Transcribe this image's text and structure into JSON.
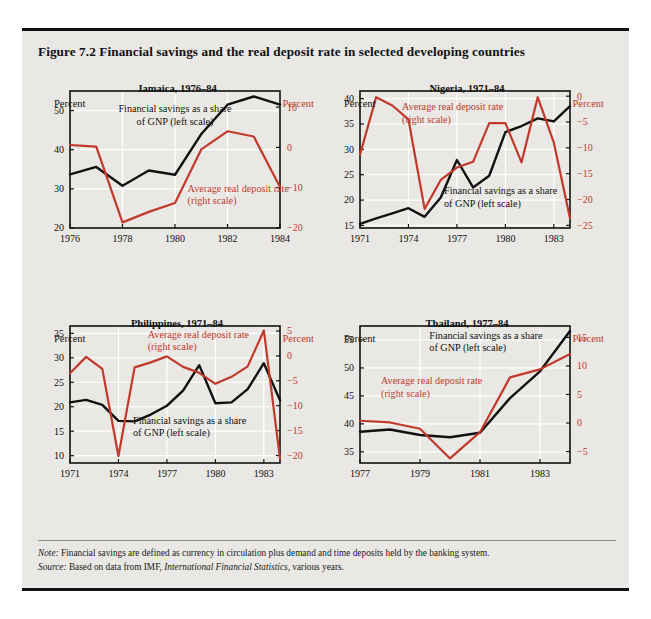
{
  "figure": {
    "title": "Figure 7.2  Financial savings and the real deposit rate in selected developing countries",
    "note_lead": "Note:",
    "note_text": " Financial savings are defined as currency in circulation plus demand and time deposits held by the banking system.",
    "source_lead": "Source:",
    "source_text_a": " Based on data from IMF, ",
    "source_text_b": "International Financial Statistics",
    "source_text_c": ", various years.",
    "colors": {
      "savings_line": "#111111",
      "deposit_line": "#c0392b",
      "panel_background": "#e9e8e4",
      "grid": "#ffffff",
      "frame": "#111111"
    },
    "axis_caption_left": "Percent",
    "axis_caption_right": "Percent"
  },
  "chart_data": [
    {
      "id": "jamaica",
      "type": "line",
      "title": "Jamaica, 1976–84",
      "xlabel": "",
      "ylabel": "Percent",
      "ylabel_right": "Percent",
      "grid": true,
      "legend_position": "inline-annotation",
      "x": [
        1976,
        1977,
        1978,
        1979,
        1980,
        1981,
        1982,
        1983,
        1984
      ],
      "xlim": [
        1976,
        1984
      ],
      "xticks": [
        1976,
        1978,
        1980,
        1982,
        1984
      ],
      "xtick_labels": [
        "1976",
        "1978",
        "1980",
        "1982",
        "1984"
      ],
      "ylim": [
        20,
        55
      ],
      "yticks": [
        20,
        30,
        40,
        50
      ],
      "ytick_labels": [
        "20",
        "30",
        "40",
        "50"
      ],
      "ylim_right": [
        -20,
        14
      ],
      "yticks_right": [
        -20,
        -10,
        0,
        10
      ],
      "ytick_labels_right": [
        "−20",
        "−10",
        "0",
        "10"
      ],
      "series": [
        {
          "name": "Financial savings as a share of GNP (left scale)",
          "axis": "left",
          "color": "#111111",
          "values": [
            33.7,
            35.6,
            30.8,
            34.7,
            33.6,
            44.0,
            51.5,
            53.6,
            51.5
          ]
        },
        {
          "name": "Average real deposit rate (right scale)",
          "axis": "right",
          "color": "#c0392b",
          "values": [
            0.6,
            0.2,
            -18.6,
            -16.0,
            -13.8,
            -0.5,
            4.0,
            2.7,
            -9.8
          ]
        }
      ],
      "annotations": [
        {
          "text_lines": [
            "Financial savings as a share",
            "of GNP (left scale)"
          ],
          "color": "#111111",
          "x": 0.5,
          "y": 0.155,
          "anchor": "middle"
        },
        {
          "text_lines": [
            "Average real deposit rate",
            "(right scale)"
          ],
          "color": "#c0392b",
          "x": 0.56,
          "y": 0.735,
          "anchor": "start"
        }
      ]
    },
    {
      "id": "nigeria",
      "type": "line",
      "title": "Nigeria, 1971–84",
      "xlabel": "",
      "ylabel": "Percent",
      "ylabel_right": "Percent",
      "grid": true,
      "legend_position": "inline-annotation",
      "x": [
        1971,
        1972,
        1973,
        1974,
        1975,
        1976,
        1977,
        1978,
        1979,
        1980,
        1981,
        1982,
        1983,
        1984
      ],
      "xlim": [
        1971,
        1984
      ],
      "xticks": [
        1971,
        1974,
        1977,
        1980,
        1983
      ],
      "xtick_labels": [
        "1971",
        "1974",
        "1977",
        "1980",
        "1983"
      ],
      "ylim": [
        14.5,
        41.5
      ],
      "yticks": [
        15,
        20,
        25,
        30,
        35,
        40
      ],
      "ytick_labels": [
        "15",
        "20",
        "25",
        "30",
        "35",
        "40"
      ],
      "ylim_right": [
        -25.5,
        1.0
      ],
      "yticks_right": [
        -25,
        -20,
        -15,
        -10,
        -5,
        0
      ],
      "ytick_labels_right": [
        "−25",
        "−20",
        "−15",
        "−10",
        "−5",
        "0"
      ],
      "series": [
        {
          "name": "Financial savings as a share of GNP (left scale)",
          "axis": "left",
          "color": "#111111",
          "values": [
            15.3,
            16.4,
            17.4,
            18.4,
            16.7,
            20.5,
            27.9,
            22.5,
            24.8,
            33.4,
            34.6,
            36.1,
            35.5,
            38.5
          ]
        },
        {
          "name": "Average real deposit rate (right scale)",
          "axis": "right",
          "color": "#c0392b",
          "values": [
            -11.3,
            -0.2,
            -1.8,
            -4.5,
            -21.8,
            -16.2,
            -13.8,
            -12.7,
            -5.2,
            -5.2,
            -12.8,
            -0.2,
            -9.0,
            -23.6
          ]
        }
      ],
      "annotations": [
        {
          "text_lines": [
            "Average real deposit rate",
            "(right scale)"
          ],
          "color": "#c0392b",
          "x": 0.2,
          "y": 0.14,
          "anchor": "start"
        },
        {
          "text_lines": [
            "Financial savings as a share",
            "of GNP (left scale)"
          ],
          "color": "#111111",
          "x": 0.4,
          "y": 0.755,
          "anchor": "start"
        }
      ]
    },
    {
      "id": "philippines",
      "type": "line",
      "title": "Philippines, 1971–84",
      "xlabel": "",
      "ylabel": "Percent",
      "ylabel_right": "Percent",
      "grid": true,
      "legend_position": "inline-annotation",
      "x": [
        1971,
        1972,
        1973,
        1974,
        1975,
        1976,
        1977,
        1978,
        1979,
        1980,
        1981,
        1982,
        1983,
        1984
      ],
      "xlim": [
        1971,
        1984
      ],
      "xticks": [
        1971,
        1974,
        1977,
        1980,
        1983
      ],
      "xtick_labels": [
        "1971",
        "1974",
        "1977",
        "1980",
        "1983"
      ],
      "ylim": [
        8.5,
        36.5
      ],
      "yticks": [
        10,
        15,
        20,
        25,
        30,
        35
      ],
      "ytick_labels": [
        "10",
        "15",
        "20",
        "25",
        "30",
        "35"
      ],
      "ylim_right": [
        -21.5,
        6.0
      ],
      "yticks_right": [
        -20,
        -15,
        -10,
        -5,
        0,
        5
      ],
      "ytick_labels_right": [
        "−20",
        "−15",
        "−10",
        "−5",
        "0",
        "5"
      ],
      "series": [
        {
          "name": "Financial savings as a share of GNP (left scale)",
          "axis": "left",
          "color": "#111111",
          "values": [
            20.9,
            21.4,
            20.4,
            17.1,
            17.0,
            18.4,
            20.2,
            23.3,
            28.5,
            20.7,
            20.9,
            23.6,
            28.9,
            21.3
          ]
        },
        {
          "name": "Average real deposit rate (right scale)",
          "axis": "right",
          "color": "#c0392b",
          "values": [
            -3.5,
            -0.2,
            -2.6,
            -20.1,
            -2.3,
            -1.3,
            -0.1,
            -2.2,
            -3.4,
            -5.6,
            -4.2,
            -2.1,
            5.1,
            -20.6
          ]
        }
      ],
      "annotations": [
        {
          "text_lines": [
            "Average real deposit rate",
            "(right scale)"
          ],
          "color": "#c0392b",
          "x": 0.37,
          "y": 0.085,
          "anchor": "start"
        },
        {
          "text_lines": [
            "Financial savings as a share",
            "of GNP (left scale)"
          ],
          "color": "#111111",
          "x": 0.3,
          "y": 0.715,
          "anchor": "start"
        }
      ]
    },
    {
      "id": "thailand",
      "type": "line",
      "title": "Thailand, 1977–84",
      "xlabel": "",
      "ylabel": "Percent",
      "ylabel_right": "Percent",
      "grid": true,
      "legend_position": "inline-annotation",
      "x": [
        1977,
        1978,
        1979,
        1980,
        1981,
        1982,
        1983,
        1984
      ],
      "xlim": [
        1977,
        1984
      ],
      "xticks": [
        1977,
        1979,
        1981,
        1983
      ],
      "xtick_labels": [
        "1977",
        "1979",
        "1981",
        "1983"
      ],
      "ylim": [
        33.0,
        57.5
      ],
      "yticks": [
        35,
        40,
        45,
        50,
        55
      ],
      "ytick_labels": [
        "35",
        "40",
        "45",
        "50",
        "55"
      ],
      "ylim_right": [
        -7.0,
        17.0
      ],
      "yticks_right": [
        -5,
        0,
        5,
        10,
        15
      ],
      "ytick_labels_right": [
        "−5",
        "0",
        "5",
        "10",
        "15"
      ],
      "series": [
        {
          "name": "Financial savings as a share of GNP (left scale)",
          "axis": "left",
          "color": "#111111",
          "values": [
            38.6,
            39.0,
            38.0,
            37.6,
            38.4,
            44.6,
            49.4,
            56.6
          ]
        },
        {
          "name": "Average real deposit rate (right scale)",
          "axis": "right",
          "color": "#c0392b",
          "values": [
            0.4,
            0.1,
            -1.0,
            -6.2,
            -1.6,
            8.0,
            9.4,
            12.1
          ]
        }
      ],
      "annotations": [
        {
          "text_lines": [
            "Financial savings as a share",
            "of GNP (left scale)"
          ],
          "color": "#111111",
          "x": 0.33,
          "y": 0.095,
          "anchor": "start"
        },
        {
          "text_lines": [
            "Average real deposit rate",
            "(right scale)"
          ],
          "color": "#c0392b",
          "x": 0.1,
          "y": 0.425,
          "anchor": "start"
        }
      ]
    }
  ]
}
